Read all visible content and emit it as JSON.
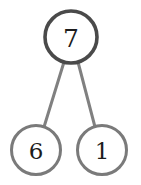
{
  "diagram": {
    "type": "number-bond",
    "background_color": "#ffffff",
    "whole": {
      "value": "7",
      "cx": 71,
      "cy": 37,
      "r": 26,
      "stroke_color": "#4a4a4a",
      "stroke_width": 3.6,
      "fill_color": "#ffffff",
      "text_color": "#1c1c1c",
      "font_size": 25
    },
    "parts": [
      {
        "value": "6",
        "cx": 36,
        "cy": 150,
        "r": 24.5,
        "stroke_color": "#7a7a7a",
        "stroke_width": 3.0,
        "fill_color": "#ffffff",
        "text_color": "#1c1c1c",
        "font_size": 23
      },
      {
        "value": "1",
        "cx": 102,
        "cy": 150,
        "r": 24.5,
        "stroke_color": "#7a7a7a",
        "stroke_width": 3.0,
        "fill_color": "#ffffff",
        "text_color": "#1c1c1c",
        "font_size": 23
      }
    ],
    "connectors": [
      {
        "name": "left",
        "x1": 64,
        "y1": 62,
        "x2": 44,
        "y2": 127,
        "stroke_color": "#808080",
        "stroke_width": 3.0
      },
      {
        "name": "right",
        "x1": 78,
        "y1": 62,
        "x2": 95,
        "y2": 127,
        "stroke_color": "#808080",
        "stroke_width": 3.0
      }
    ]
  }
}
